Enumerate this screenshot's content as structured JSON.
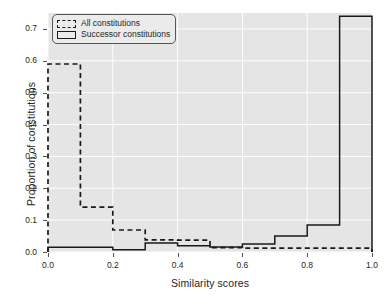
{
  "chart_data": {
    "type": "line",
    "title": "",
    "xlabel": "Similarity scores",
    "ylabel": "Proportion of constitutions",
    "xlim": [
      0.0,
      1.0
    ],
    "ylim": [
      0.0,
      0.75
    ],
    "grid": true,
    "legend_position": "upper left",
    "bin_edges": [
      0.0,
      0.1,
      0.2,
      0.3,
      0.4,
      0.5,
      0.6,
      0.7,
      0.8,
      0.9,
      1.0
    ],
    "xticks": [
      "0.0",
      "0.2",
      "0.4",
      "0.6",
      "0.8",
      "1.0"
    ],
    "xtick_values": [
      0.0,
      0.2,
      0.4,
      0.6,
      0.8,
      1.0
    ],
    "yticks": [
      "0.0",
      "0.1",
      "0.2",
      "0.3",
      "0.4",
      "0.5",
      "0.6",
      "0.7"
    ],
    "ytick_values": [
      0.0,
      0.1,
      0.2,
      0.3,
      0.4,
      0.5,
      0.6,
      0.7
    ],
    "series": [
      {
        "name": "All constitutions",
        "style": "dashed",
        "color": "#1a1a1a",
        "values": [
          0.59,
          0.141,
          0.069,
          0.038,
          0.037,
          0.014,
          0.012,
          0.012,
          0.012,
          0.012
        ]
      },
      {
        "name": "Successor constitutions",
        "style": "solid",
        "color": "#1a1a1a",
        "values": [
          0.015,
          0.015,
          0.007,
          0.028,
          0.02,
          0.016,
          0.025,
          0.05,
          0.085,
          0.74
        ]
      }
    ]
  },
  "legend": {
    "items": [
      {
        "label": "All constitutions",
        "style": "dashed"
      },
      {
        "label": "Successor constitutions",
        "style": "solid"
      }
    ]
  },
  "colors": {
    "plot_background": "#e5e5e5",
    "figure_background": "#ffffff",
    "gridline": "#ffffff",
    "line": "#1a1a1a",
    "text": "#262626"
  }
}
